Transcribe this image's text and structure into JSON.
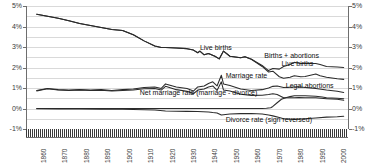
{
  "chart_data": {
    "type": "line",
    "title": "",
    "xlabel": "",
    "ylabel": "",
    "xlim": [
      1855,
      2005
    ],
    "ylim": [
      -1,
      5
    ],
    "grid": true,
    "legend_position": "inline-annotations",
    "y_ticks_left": [
      "5%",
      "4%",
      "3%",
      "2%",
      "1%",
      "0%",
      "-1%"
    ],
    "y_ticks_right": [
      "5%",
      "4%",
      "3%",
      "2%",
      "1%",
      "0%",
      "-1%"
    ],
    "x_ticks": [
      "1860",
      "1870",
      "1880",
      "1890",
      "1900",
      "1910",
      "1920",
      "1930",
      "1940",
      "1950",
      "1960",
      "1970",
      "1980",
      "1990",
      "2000"
    ],
    "annotations": [
      {
        "text": "Live births",
        "x": 1936,
        "y": 2.95
      },
      {
        "text": "Births + abortions",
        "x": 1966,
        "y": 2.55
      },
      {
        "text": "Live births",
        "x": 1974,
        "y": 2.15
      },
      {
        "text": "Marriage rate",
        "x": 1948,
        "y": 1.6
      },
      {
        "text": "Legal abortions",
        "x": 1976,
        "y": 1.1
      },
      {
        "text": "Net marriage rate (marriage - divorce)",
        "x": 1908,
        "y": 0.78
      },
      {
        "text": "Divorce rate (sign reversed)",
        "x": 1948,
        "y": -0.55
      }
    ],
    "series": [
      {
        "name": "Births + abortions",
        "x": [
          1860,
          1865,
          1870,
          1875,
          1880,
          1885,
          1890,
          1895,
          1900,
          1905,
          1910,
          1915,
          1918,
          1920,
          1925,
          1930,
          1933,
          1935,
          1936,
          1938,
          1940,
          1943,
          1945,
          1947,
          1950,
          1955,
          1957,
          1960,
          1965,
          1968,
          1970,
          1973,
          1975,
          1978,
          1980,
          1983,
          1985,
          1990,
          1992,
          1995,
          2000,
          2003
        ],
        "values": [
          4.6,
          4.5,
          4.4,
          4.28,
          4.15,
          4.05,
          3.95,
          3.85,
          3.8,
          3.6,
          3.3,
          3.05,
          2.98,
          2.98,
          2.95,
          2.92,
          2.85,
          2.72,
          2.8,
          2.62,
          2.68,
          2.55,
          2.42,
          2.8,
          2.55,
          2.48,
          2.52,
          2.4,
          2.1,
          1.85,
          1.95,
          1.92,
          2.05,
          2.15,
          2.25,
          2.2,
          2.2,
          2.2,
          2.15,
          2.05,
          2.02,
          2.0
        ]
      },
      {
        "name": "Live births",
        "x": [
          1860,
          1865,
          1870,
          1875,
          1880,
          1885,
          1890,
          1895,
          1900,
          1905,
          1910,
          1915,
          1918,
          1920,
          1925,
          1930,
          1933,
          1935,
          1936,
          1938,
          1940,
          1943,
          1945,
          1947,
          1950,
          1955,
          1957,
          1960,
          1965,
          1968,
          1970,
          1973,
          1975,
          1978,
          1980,
          1983,
          1985,
          1990,
          1992,
          1995,
          2000,
          2003
        ],
        "values": [
          4.6,
          4.5,
          4.4,
          4.28,
          4.15,
          4.05,
          3.95,
          3.85,
          3.8,
          3.6,
          3.3,
          3.05,
          2.98,
          2.98,
          2.95,
          2.92,
          2.85,
          2.72,
          2.8,
          2.62,
          2.68,
          2.55,
          2.42,
          2.8,
          2.55,
          2.48,
          2.52,
          2.4,
          2.05,
          1.78,
          1.82,
          1.55,
          1.48,
          1.52,
          1.6,
          1.55,
          1.56,
          1.68,
          1.6,
          1.52,
          1.45,
          1.42
        ]
      },
      {
        "name": "Marriage rate",
        "x": [
          1860,
          1865,
          1870,
          1875,
          1880,
          1885,
          1890,
          1895,
          1900,
          1905,
          1910,
          1915,
          1918,
          1920,
          1925,
          1930,
          1933,
          1935,
          1938,
          1940,
          1942,
          1944,
          1946,
          1947,
          1950,
          1955,
          1960,
          1965,
          1968,
          1970,
          1972,
          1975,
          1980,
          1982,
          1985,
          1990,
          1995,
          2000,
          2003
        ],
        "values": [
          0.88,
          0.98,
          0.92,
          0.9,
          0.92,
          0.9,
          0.92,
          0.88,
          0.92,
          0.95,
          1.02,
          1.05,
          0.98,
          1.2,
          1.05,
          0.98,
          0.85,
          1.05,
          1.1,
          1.22,
          1.3,
          1.1,
          1.62,
          1.2,
          1.12,
          0.95,
          0.88,
          0.92,
          1.0,
          1.08,
          1.1,
          1.02,
          1.05,
          1.06,
          1.02,
          0.98,
          0.9,
          0.84,
          0.78
        ]
      },
      {
        "name": "Net marriage rate (marriage - divorce)",
        "x": [
          1860,
          1865,
          1870,
          1875,
          1880,
          1885,
          1890,
          1895,
          1900,
          1905,
          1910,
          1915,
          1918,
          1920,
          1925,
          1930,
          1933,
          1935,
          1938,
          1940,
          1942,
          1944,
          1946,
          1947,
          1950,
          1955,
          1960,
          1965,
          1968,
          1970,
          1972,
          1975,
          1980,
          1982,
          1985,
          1990,
          1995,
          2000,
          2003
        ],
        "values": [
          0.86,
          0.96,
          0.9,
          0.88,
          0.9,
          0.88,
          0.89,
          0.85,
          0.88,
          0.9,
          0.96,
          0.98,
          0.9,
          1.08,
          0.92,
          0.84,
          0.72,
          0.9,
          0.95,
          1.05,
          1.1,
          0.88,
          1.3,
          0.9,
          0.85,
          0.7,
          0.64,
          0.65,
          0.68,
          0.72,
          0.68,
          0.52,
          0.52,
          0.54,
          0.52,
          0.52,
          0.48,
          0.45,
          0.4
        ]
      },
      {
        "name": "Legal abortions",
        "x": [
          1860,
          1900,
          1940,
          1960,
          1965,
          1967,
          1969,
          1970,
          1972,
          1974,
          1976,
          1978,
          1980,
          1983,
          1985,
          1990,
          1993,
          1995,
          2000,
          2003
        ],
        "values": [
          0.0,
          0.0,
          0.0,
          0.0,
          0.0,
          0.01,
          0.04,
          0.1,
          0.28,
          0.45,
          0.52,
          0.58,
          0.62,
          0.62,
          0.62,
          0.6,
          0.56,
          0.52,
          0.5,
          0.48
        ]
      },
      {
        "name": "Divorce rate (sign reversed)",
        "x": [
          1860,
          1870,
          1880,
          1890,
          1900,
          1910,
          1915,
          1920,
          1925,
          1930,
          1935,
          1940,
          1942,
          1944,
          1946,
          1947,
          1950,
          1955,
          1960,
          1965,
          1968,
          1970,
          1973,
          1975,
          1980,
          1982,
          1985,
          1990,
          1995,
          2000,
          2003
        ],
        "values": [
          -0.01,
          -0.02,
          -0.02,
          -0.03,
          -0.04,
          -0.06,
          -0.07,
          -0.12,
          -0.13,
          -0.14,
          -0.15,
          -0.17,
          -0.2,
          -0.22,
          -0.32,
          -0.3,
          -0.27,
          -0.25,
          -0.24,
          -0.27,
          -0.32,
          -0.36,
          -0.44,
          -0.5,
          -0.53,
          -0.52,
          -0.5,
          -0.46,
          -0.42,
          -0.4,
          -0.38
        ]
      }
    ]
  },
  "colors": {
    "line": "#2b2b2b",
    "grid": "#d9d9d9",
    "axis": "#6e6e6e",
    "text": "#3a3a3a",
    "background": "#ffffff"
  }
}
